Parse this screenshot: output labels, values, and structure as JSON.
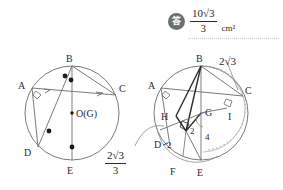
{
  "answer": {
    "badge_glyph": "答",
    "numerator": "10√3",
    "denominator": "3",
    "unit": "cm²"
  },
  "labels": {
    "left_circle": {
      "A": "A",
      "B": "B",
      "C": "C",
      "D": "D",
      "E": "E",
      "center": "O(G)"
    },
    "right_circle": {
      "A": "A",
      "B": "B",
      "C": "C",
      "D": "D",
      "E": "E",
      "F": "F",
      "G": "G",
      "H": "H",
      "I": "I"
    }
  },
  "measurements": {
    "bc_length": "2√3",
    "dg_segment": "2",
    "hd_segment": "2",
    "ge_segment": "4",
    "callout_numerator": "2√3",
    "callout_denominator": "3"
  },
  "colors": {
    "stroke": "#6b6b6b",
    "stroke_dark": "#2b2b2b",
    "badge": "#6e6e6e",
    "background": "#ffffff",
    "dot": "#1a1a1a"
  }
}
